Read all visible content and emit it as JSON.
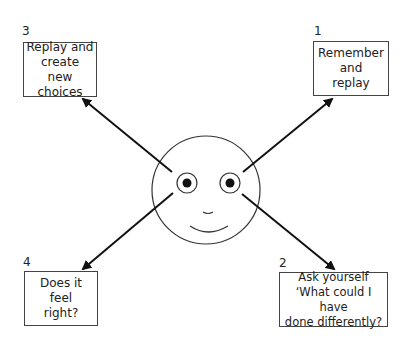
{
  "diagram": {
    "title": "",
    "center": {
      "type": "smiley-face"
    },
    "steps": [
      {
        "number": "1",
        "lines": [
          "Remember",
          "and",
          "replay"
        ],
        "position": "top-right"
      },
      {
        "number": "2",
        "lines": [
          "Ask yourself",
          "‘What could I have",
          "done differently?"
        ],
        "position": "bottom-right"
      },
      {
        "number": "3",
        "lines": [
          "Replay and",
          "create",
          "new choices"
        ],
        "position": "top-left"
      },
      {
        "number": "4",
        "lines": [
          "Does it",
          "feel",
          "right?"
        ],
        "position": "bottom-left"
      }
    ],
    "arrows": [
      {
        "from": "face",
        "to": "step-1"
      },
      {
        "from": "face",
        "to": "step-2"
      },
      {
        "from": "face",
        "to": "step-3"
      },
      {
        "from": "face",
        "to": "step-4"
      }
    ],
    "colors": {
      "stroke": "#1a1a1a",
      "box_border": "#444444",
      "background": "#ffffff"
    }
  }
}
